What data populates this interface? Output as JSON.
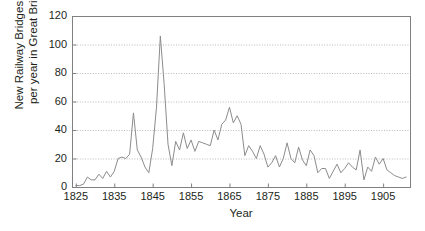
{
  "chart_data": {
    "type": "line",
    "title": "",
    "xlabel": "Year",
    "ylabel": "New Railway Bridges built\nper year in Great Britain",
    "ylabel_line1": "New Railway Bridges built",
    "ylabel_line2": "per year in Great Britain",
    "xlim": [
      1824,
      1912
    ],
    "ylim": [
      0,
      120
    ],
    "yticks": [
      0,
      20,
      40,
      60,
      80,
      100,
      120
    ],
    "ytick_labels": [
      "0",
      "20",
      "40",
      "60",
      "80",
      "100",
      "120"
    ],
    "xticks": [
      1825,
      1835,
      1845,
      1855,
      1865,
      1875,
      1885,
      1895,
      1905
    ],
    "xtick_labels": [
      "1825",
      "1835",
      "1845",
      "1855",
      "1865",
      "1875",
      "1885",
      "1895",
      "1905"
    ],
    "grid": "horizontal-dotted",
    "legend": "none",
    "line_color": "#8c8c8c",
    "axis_color": "#808080",
    "grid_color": "#b9b9b9",
    "text_color": "#231f20",
    "background": "#ffffff",
    "series": [
      {
        "name": "New Railway Bridges built per year in Great Britain",
        "x": [
          1825,
          1826,
          1827,
          1828,
          1829,
          1830,
          1831,
          1832,
          1833,
          1834,
          1835,
          1836,
          1837,
          1838,
          1839,
          1840,
          1841,
          1842,
          1843,
          1844,
          1845,
          1846,
          1847,
          1848,
          1849,
          1850,
          1851,
          1852,
          1853,
          1854,
          1855,
          1856,
          1857,
          1858,
          1859,
          1860,
          1861,
          1862,
          1863,
          1864,
          1865,
          1866,
          1867,
          1868,
          1869,
          1870,
          1871,
          1872,
          1873,
          1874,
          1875,
          1876,
          1877,
          1878,
          1879,
          1880,
          1881,
          1882,
          1883,
          1884,
          1885,
          1886,
          1887,
          1888,
          1889,
          1890,
          1891,
          1892,
          1893,
          1894,
          1895,
          1896,
          1897,
          1898,
          1899,
          1900,
          1901,
          1902,
          1903,
          1904,
          1905,
          1906,
          1907,
          1908,
          1909,
          1910,
          1911
        ],
        "values": [
          1,
          1,
          2,
          7,
          5,
          5,
          9,
          6,
          11,
          7,
          11,
          20,
          21,
          20,
          23,
          52,
          26,
          21,
          14,
          10,
          27,
          56,
          106,
          72,
          30,
          15,
          32,
          26,
          38,
          27,
          33,
          25,
          32,
          31,
          30,
          29,
          40,
          33,
          44,
          47,
          56,
          45,
          50,
          44,
          22,
          29,
          25,
          20,
          29,
          23,
          14,
          17,
          22,
          14,
          20,
          31,
          20,
          17,
          28,
          19,
          15,
          26,
          22,
          10,
          13,
          13,
          6,
          11,
          16,
          10,
          13,
          17,
          14,
          12,
          26,
          5,
          14,
          11,
          21,
          16,
          20,
          12,
          10,
          8,
          7,
          6,
          7
        ]
      }
    ]
  },
  "figure": {
    "plot_area": {
      "left": 72,
      "top": 16,
      "right": 410,
      "bottom": 187
    }
  }
}
